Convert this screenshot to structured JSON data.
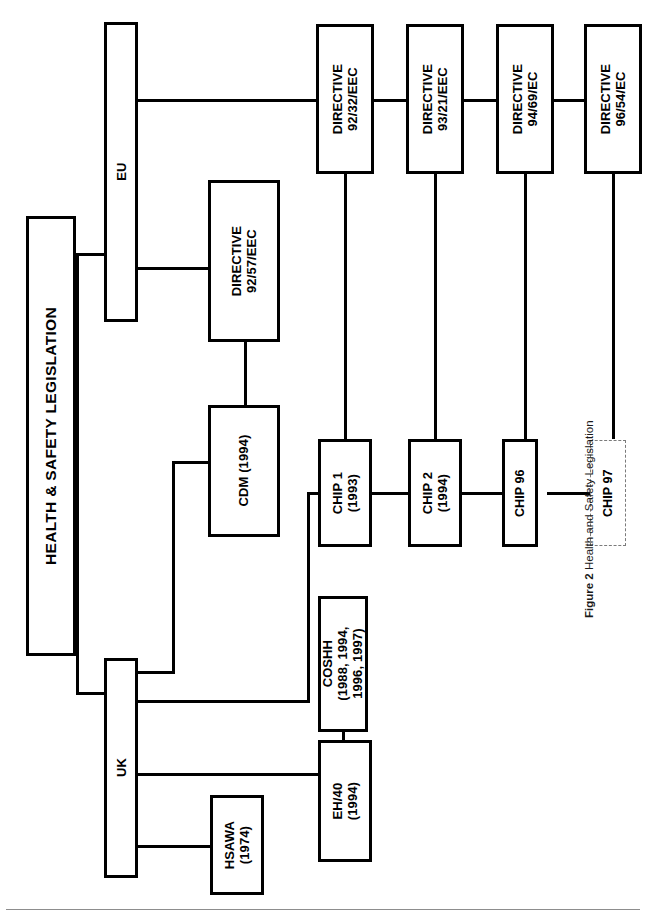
{
  "figure": {
    "number_label": "Figure 2",
    "title": "Health and Safety Legislation"
  },
  "diagram": {
    "type": "organizational-tree",
    "orientation": "rotated-90-counterclockwise",
    "root": {
      "id": "root",
      "label": "HEALTH & SAFETY LEGISLATION"
    },
    "branches": [
      {
        "id": "eu",
        "label": "EU"
      },
      {
        "id": "uk",
        "label": "UK"
      }
    ],
    "nodes": [
      {
        "id": "root",
        "label": "HEALTH & SAFETY LEGISLATION",
        "style": "solid"
      },
      {
        "id": "eu",
        "label": "EU",
        "style": "solid"
      },
      {
        "id": "uk",
        "label": "UK",
        "style": "solid"
      },
      {
        "id": "dir9257",
        "label": "DIRECTIVE\n92/57/EEC",
        "style": "solid"
      },
      {
        "id": "dir9232",
        "label": "DIRECTIVE\n92/32/EEC",
        "style": "solid"
      },
      {
        "id": "dir9321",
        "label": "DIRECTIVE\n93/21/EEC",
        "style": "solid"
      },
      {
        "id": "dir9469",
        "label": "DIRECTIVE\n94/69/EC",
        "style": "solid"
      },
      {
        "id": "dir9654",
        "label": "DIRECTIVE\n96/54/EC",
        "style": "solid"
      },
      {
        "id": "cdm",
        "label": "CDM (1994)",
        "style": "solid"
      },
      {
        "id": "chip1",
        "label": "CHIP 1\n(1993)",
        "style": "solid"
      },
      {
        "id": "chip2",
        "label": "CHIP 2\n(1994)",
        "style": "solid"
      },
      {
        "id": "chip96",
        "label": "CHIP 96",
        "style": "solid"
      },
      {
        "id": "chip97",
        "label": "CHIP 97",
        "style": "dashed"
      },
      {
        "id": "coshh",
        "label": "COSHH\n(1988, 1994,\n1996, 1997)",
        "style": "solid"
      },
      {
        "id": "eh40",
        "label": "EH/40\n(1994)",
        "style": "solid"
      },
      {
        "id": "hsawa",
        "label": "HSAWA\n(1974)",
        "style": "solid"
      }
    ],
    "edges": [
      {
        "from": "root",
        "to": "eu"
      },
      {
        "from": "root",
        "to": "uk"
      },
      {
        "from": "eu",
        "to": "dir9257"
      },
      {
        "from": "eu",
        "to": "dir9232"
      },
      {
        "from": "dir9232",
        "to": "dir9321"
      },
      {
        "from": "dir9321",
        "to": "dir9469"
      },
      {
        "from": "dir9469",
        "to": "dir9654"
      },
      {
        "from": "dir9232",
        "to": "chip1"
      },
      {
        "from": "dir9321",
        "to": "chip2"
      },
      {
        "from": "dir9469",
        "to": "chip96"
      },
      {
        "from": "dir9654",
        "to": "chip97"
      },
      {
        "from": "dir9257",
        "to": "cdm"
      },
      {
        "from": "cdm",
        "to": "uk"
      },
      {
        "from": "chip1",
        "to": "chip2"
      },
      {
        "from": "chip2",
        "to": "chip96"
      },
      {
        "from": "chip96",
        "to": "chip97"
      },
      {
        "from": "uk",
        "to": "chip1"
      },
      {
        "from": "uk",
        "to": "eh40"
      },
      {
        "from": "uk",
        "to": "hsawa"
      },
      {
        "from": "coshh",
        "to": "eh40"
      }
    ]
  },
  "labels": {
    "root": "HEALTH & SAFETY LEGISLATION",
    "eu": "EU",
    "uk": "UK",
    "dir9257_l1": "DIRECTIVE",
    "dir9257_l2": "92/57/EEC",
    "dir9232_l1": "DIRECTIVE",
    "dir9232_l2": "92/32/EEC",
    "dir9321_l1": "DIRECTIVE",
    "dir9321_l2": "93/21/EEC",
    "dir9469_l1": "DIRECTIVE",
    "dir9469_l2": "94/69/EC",
    "dir9654_l1": "DIRECTIVE",
    "dir9654_l2": "96/54/EC",
    "cdm": "CDM (1994)",
    "chip1_l1": "CHIP 1",
    "chip1_l2": "(1993)",
    "chip2_l1": "CHIP 2",
    "chip2_l2": "(1994)",
    "chip96": "CHIP 96",
    "chip97": "CHIP 97",
    "coshh_l1": "COSHH",
    "coshh_l2": "(1988, 1994,",
    "coshh_l3": "1996, 1997)",
    "eh40_l1": "EH/40",
    "eh40_l2": "(1994)",
    "hsawa_l1": "HSAWA",
    "hsawa_l2": "(1974)"
  },
  "colors": {
    "ink": "#000000",
    "paper": "#ffffff",
    "dashed_border": "#7a7a7a",
    "rule": "#8d8d8d"
  }
}
